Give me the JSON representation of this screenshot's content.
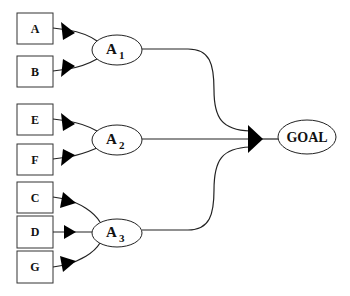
{
  "diagram": {
    "type": "AND-OR goal tree",
    "leaves": [
      {
        "id": "A",
        "label": "A"
      },
      {
        "id": "B",
        "label": "B"
      },
      {
        "id": "E",
        "label": "E"
      },
      {
        "id": "F",
        "label": "F"
      },
      {
        "id": "C",
        "label": "C"
      },
      {
        "id": "D",
        "label": "D"
      },
      {
        "id": "G",
        "label": "G"
      }
    ],
    "actions": [
      {
        "id": "A1",
        "label": "A",
        "subscript": "1",
        "inputs": [
          "A",
          "B"
        ]
      },
      {
        "id": "A2",
        "label": "A",
        "subscript": "2",
        "inputs": [
          "E",
          "F"
        ]
      },
      {
        "id": "A3",
        "label": "A",
        "subscript": "3",
        "inputs": [
          "C",
          "D",
          "G"
        ]
      }
    ],
    "goal": {
      "id": "GOAL",
      "label": "GOAL",
      "inputs": [
        "A1",
        "A2",
        "A3"
      ]
    }
  }
}
